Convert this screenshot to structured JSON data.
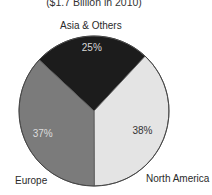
{
  "chart_data": {
    "type": "pie",
    "title": "($1.7 Billion in 2010)",
    "categories": [
      "Asia & Others",
      "North America",
      "Europe"
    ],
    "values": [
      25,
      38,
      37
    ],
    "unit": "%",
    "colors": [
      "#1c1c1c",
      "#e4e4e4",
      "#7b7b7b"
    ],
    "label_colors": [
      "#d8d8d8",
      "#333333",
      "#dddddd"
    ],
    "start_angle_deg": -47,
    "direction": "clockwise",
    "legend": "none (direct labels)"
  },
  "labels": {
    "title": "($1.7 Billion in 2010)",
    "asia": "Asia & Others",
    "asia_pct": "25%",
    "north_america": "North America",
    "north_america_pct": "38%",
    "europe": "Europe",
    "europe_pct": "37%"
  }
}
